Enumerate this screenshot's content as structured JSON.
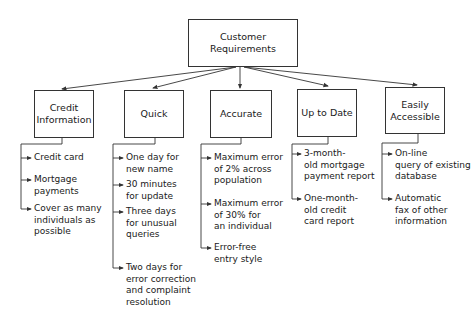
{
  "diagram": {
    "root": {
      "label": "Customer\nRequirements"
    },
    "categories": [
      {
        "label": "Credit\nInformation",
        "items": [
          "Credit card",
          "Mortgage\npayments",
          "Cover as many\nindividuals as\npossible"
        ]
      },
      {
        "label": "Quick",
        "items": [
          "One day for\nnew name",
          "30 minutes\nfor update",
          "Three days\nfor unusual\nqueries",
          "Two days for\nerror correction\nand complaint\nresolution"
        ]
      },
      {
        "label": "Accurate",
        "items": [
          "Maximum error\nof 2% across\npopulation",
          "Maximum error\nof 30% for\nan individual",
          "Error-free\nentry style"
        ]
      },
      {
        "label": "Up to Date",
        "items": [
          "3-month-\nold mortgage\npayment report",
          "One-month-\nold credit\ncard report"
        ]
      },
      {
        "label": "Easily\nAccessible",
        "items": [
          "On-line\nquery of existing\ndatabase",
          "Automatic\nfax of other\ninformation"
        ]
      }
    ],
    "colors": {
      "line": "#333333",
      "text": "#1a1a1a",
      "background": "#ffffff"
    }
  }
}
